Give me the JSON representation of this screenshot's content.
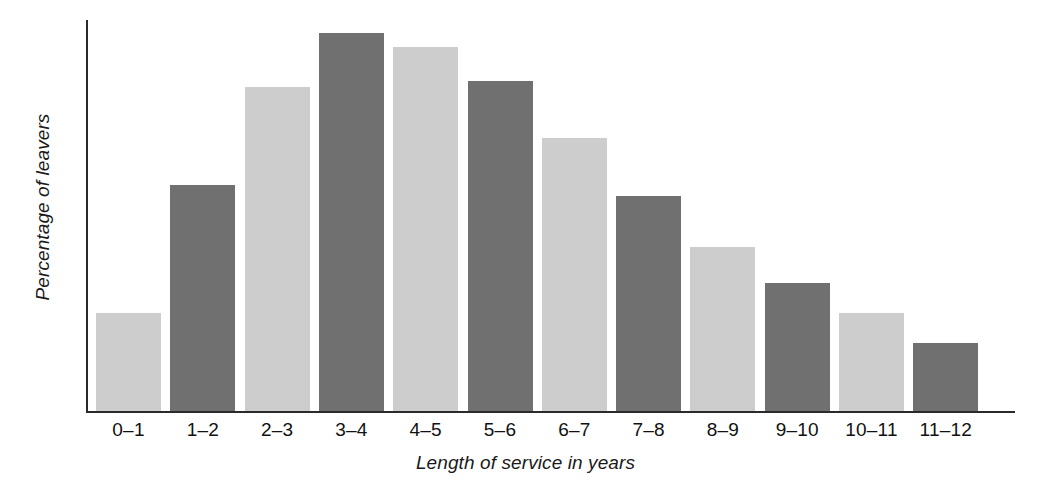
{
  "chart_data": {
    "type": "bar",
    "title": "",
    "xlabel": "Length of service in years",
    "ylabel": "Percentage of leavers",
    "categories": [
      "0–1",
      "1–2",
      "2–3",
      "3–4",
      "4–5",
      "5–6",
      "6–7",
      "7–8",
      "8–9",
      "9–10",
      "10–11",
      "11–12"
    ],
    "values": [
      25.9,
      59.8,
      85.7,
      100.0,
      96.3,
      87.3,
      72.2,
      56.9,
      43.4,
      33.9,
      25.9,
      18.0
    ],
    "bar_colors": [
      "#cdcdcd",
      "#707070",
      "#cdcdcd",
      "#707070",
      "#cdcdcd",
      "#707070",
      "#cdcdcd",
      "#707070",
      "#cdcdcd",
      "#707070",
      "#cdcdcd",
      "#707070"
    ],
    "ylim": [
      0,
      100
    ],
    "grid": false,
    "legend": "none",
    "y_ticks": [],
    "x_ticks": [
      "0–1",
      "1–2",
      "2–3",
      "3–4",
      "4–5",
      "5–6",
      "6–7",
      "7–8",
      "8–9",
      "9–10",
      "10–11",
      "11–12"
    ]
  },
  "figure": {
    "y_axis_title": "Percentage of leavers",
    "x_axis_title": "Length of service in years"
  }
}
